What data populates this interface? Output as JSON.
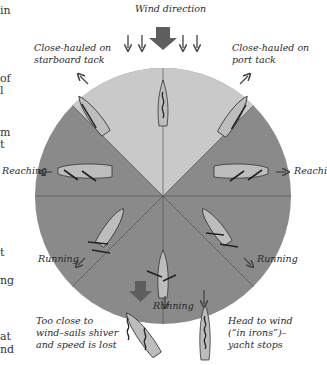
{
  "title": "Wind direction",
  "labels": {
    "close_hauled_starboard": [
      "Close-hauled on",
      "starboard tack"
    ],
    "close_hauled_port": [
      "Close-hauled on",
      "port tack"
    ],
    "reaching_left": "Reaching",
    "reaching_right": "Reachi",
    "running_left": "Running",
    "running_right": "Running",
    "running_bottom": "Running",
    "too_close": [
      "Too close to",
      "wind–sails shiver",
      "and speed is lost"
    ],
    "head_to_wind": [
      "Head to wind",
      "(“in irons”)–",
      "yacht stops"
    ]
  },
  "margin_fragments": [
    {
      "text": "in",
      "y": 4
    },
    {
      "text": "of",
      "y": 72
    },
    {
      "text": "l",
      "y": 84
    },
    {
      "text": "m",
      "y": 126
    },
    {
      "text": "t",
      "y": 138
    },
    {
      "text": "t",
      "y": 246
    },
    {
      "text": "ng",
      "y": 274
    },
    {
      "text": "at",
      "y": 330
    },
    {
      "text": "nd",
      "y": 343
    }
  ],
  "colors": {
    "sector_dark": "#8a8a8a",
    "sector_light": "#c9c9c9",
    "boat": "#bdbdbd",
    "arrow": "#5e5e5e"
  }
}
